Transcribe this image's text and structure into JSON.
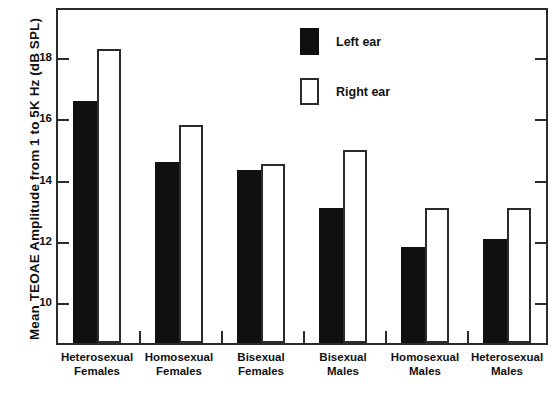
{
  "chart_data": {
    "type": "bar",
    "title": "",
    "xlabel": "",
    "ylabel": "Mean TEOAE Amplitude from 1 to 5K Hz (dB SPL)",
    "categories": [
      "Heterosexual Females",
      "Homosexual Females",
      "Bisexual Females",
      "Bisexual Males",
      "Homosexual Males",
      "Heterosexual Males"
    ],
    "category_lines": [
      [
        "Heterosexual",
        "Females"
      ],
      [
        "Homosexual",
        "Females"
      ],
      [
        "Bisexual",
        "Females"
      ],
      [
        "Bisexual",
        "Males"
      ],
      [
        "Homosexual",
        "Males"
      ],
      [
        "Heterosexual",
        "Males"
      ]
    ],
    "series": [
      {
        "name": "Left ear",
        "color": "#101010",
        "style": "filled",
        "values": [
          16.5,
          14.5,
          14.25,
          13.0,
          11.75,
          12.0
        ]
      },
      {
        "name": "Right ear",
        "color": "#ffffff",
        "style": "hollow",
        "values": [
          18.2,
          15.7,
          14.45,
          14.9,
          13.0,
          13.0
        ]
      }
    ],
    "ylim": [
      8.6,
      19.6
    ],
    "yticks": [
      10,
      12,
      14,
      16,
      18
    ],
    "ytick_labels": [
      "10",
      "12",
      "14",
      "16",
      "18"
    ],
    "grid": false,
    "legend_position": "top-right"
  },
  "legend": {
    "entries": [
      {
        "label": "Left ear",
        "style": "filled"
      },
      {
        "label": "Right ear",
        "style": "hollow"
      }
    ]
  },
  "axis": {
    "y_title": "Mean TEOAE Amplitude from 1 to 5K Hz (dB SPL)"
  }
}
